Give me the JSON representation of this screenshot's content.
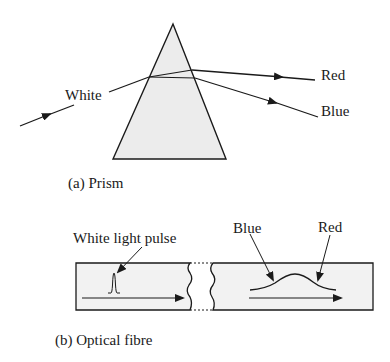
{
  "prism_panel": {
    "labels": {
      "white": "White",
      "red": "Red",
      "blue": "Blue"
    },
    "caption": "(a) Prism",
    "prism_fill": "#ececec",
    "stroke_color": "#1a1a1a"
  },
  "fibre_panel": {
    "labels": {
      "white_light_pulse": "White light pulse",
      "blue": "Blue",
      "red": "Red"
    },
    "caption": "(b) Optical fibre",
    "fibre_fill": "#f2f2f2",
    "stroke_color": "#1a1a1a"
  }
}
